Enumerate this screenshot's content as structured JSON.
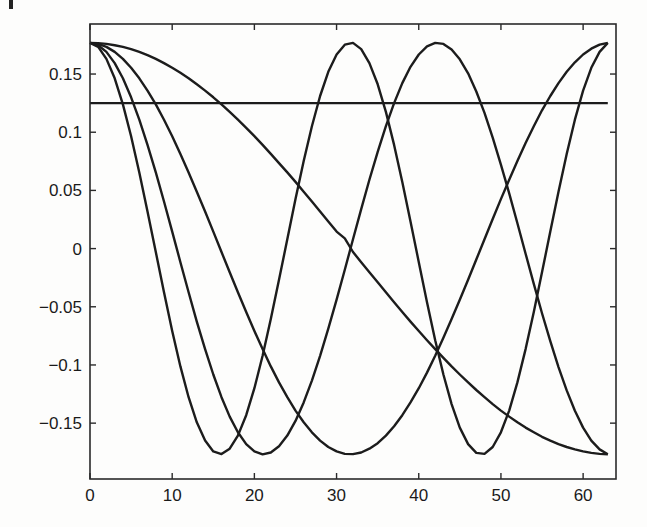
{
  "chart_data": {
    "type": "line",
    "title": "",
    "xlabel": "",
    "ylabel": "",
    "xlim": [
      0,
      64
    ],
    "ylim": [
      -0.198,
      0.193
    ],
    "grid": false,
    "legend": null,
    "x_ticks": [
      0,
      10,
      20,
      30,
      40,
      50,
      60
    ],
    "x_tick_labels": [
      "0",
      "10",
      "20",
      "30",
      "40",
      "50",
      "60"
    ],
    "y_ticks": [
      0.15,
      0.1,
      0.05,
      0,
      -0.05,
      -0.1,
      -0.15
    ],
    "y_tick_labels": [
      "0.15",
      "0.1",
      "0.05",
      "0",
      "−0.05",
      "−0.1",
      "−0.15"
    ],
    "x": [
      0,
      1,
      2,
      3,
      4,
      5,
      6,
      7,
      8,
      9,
      10,
      11,
      12,
      13,
      14,
      15,
      16,
      17,
      18,
      19,
      20,
      21,
      22,
      23,
      24,
      25,
      26,
      27,
      28,
      29,
      30,
      31,
      32,
      33,
      34,
      35,
      36,
      37,
      38,
      39,
      40,
      41,
      42,
      43,
      44,
      45,
      46,
      47,
      48,
      49,
      50,
      51,
      52,
      53,
      54,
      55,
      56,
      57,
      58,
      59,
      60,
      61,
      62,
      63
    ],
    "series": [
      {
        "name": "k=0",
        "values": [
          0.125,
          0.125,
          0.125,
          0.125,
          0.125,
          0.125,
          0.125,
          0.125,
          0.125,
          0.125,
          0.125,
          0.125,
          0.125,
          0.125,
          0.125,
          0.125,
          0.125,
          0.125,
          0.125,
          0.125,
          0.125,
          0.125,
          0.125,
          0.125,
          0.125,
          0.125,
          0.125,
          0.125,
          0.125,
          0.125,
          0.125,
          0.125,
          0.125,
          0.125,
          0.125,
          0.125,
          0.125,
          0.125,
          0.125,
          0.125,
          0.125,
          0.125,
          0.125,
          0.125,
          0.125,
          0.125,
          0.125,
          0.125,
          0.125,
          0.125,
          0.125,
          0.125,
          0.125,
          0.125,
          0.125,
          0.125,
          0.125,
          0.125,
          0.125,
          0.125,
          0.125,
          0.125,
          0.125,
          0.125
        ]
      },
      {
        "name": "k=1",
        "values": [
          0.1768,
          0.1766,
          0.1759,
          0.1748,
          0.1733,
          0.1714,
          0.169,
          0.1662,
          0.163,
          0.1594,
          0.1554,
          0.1511,
          0.1463,
          0.1412,
          0.1358,
          0.13,
          0.1239,
          0.1175,
          0.1108,
          0.1038,
          0.0966,
          0.0891,
          0.0814,
          0.0735,
          0.0655,
          0.0573,
          0.0489,
          0.0405,
          0.0319,
          0.0233,
          0.0146,
          0.0088,
          -0.0029,
          -0.0117,
          -0.0204,
          -0.029,
          -0.0376,
          -0.0461,
          -0.0545,
          -0.0627,
          -0.0708,
          -0.0787,
          -0.0864,
          -0.0939,
          -0.1012,
          -0.1082,
          -0.115,
          -0.1215,
          -0.1277,
          -0.1336,
          -0.1392,
          -0.1444,
          -0.1493,
          -0.1538,
          -0.1579,
          -0.1617,
          -0.165,
          -0.168,
          -0.1705,
          -0.1726,
          -0.1743,
          -0.1756,
          -0.1764,
          -0.1768
        ]
      },
      {
        "name": "k=2",
        "values": [
          0.1768,
          0.1759,
          0.1733,
          0.169,
          0.163,
          0.1554,
          0.1463,
          0.1358,
          0.1239,
          0.1108,
          0.0966,
          0.0814,
          0.0655,
          0.0489,
          0.0319,
          0.0146,
          -0.0029,
          -0.0204,
          -0.0376,
          -0.0545,
          -0.0708,
          -0.0864,
          -0.1012,
          -0.115,
          -0.1277,
          -0.1392,
          -0.1493,
          -0.1579,
          -0.165,
          -0.1705,
          -0.1743,
          -0.1764,
          -0.1766,
          -0.1752,
          -0.172,
          -0.1672,
          -0.1607,
          -0.1527,
          -0.1432,
          -0.1322,
          -0.12,
          -0.1066,
          -0.0921,
          -0.0767,
          -0.0606,
          -0.0439,
          -0.0268,
          -0.0094,
          0.008,
          0.0254,
          0.0425,
          0.0592,
          0.0753,
          0.0907,
          0.1052,
          0.1188,
          0.1311,
          0.1422,
          0.1519,
          0.1601,
          0.1668,
          0.1718,
          0.1752,
          0.1768
        ]
      },
      {
        "name": "k=3",
        "values": [
          0.1768,
          0.1748,
          0.169,
          0.1594,
          0.1463,
          0.13,
          0.1108,
          0.0891,
          0.0655,
          0.0405,
          0.0146,
          -0.0117,
          -0.0376,
          -0.0627,
          -0.0864,
          -0.1082,
          -0.1277,
          -0.1444,
          -0.1579,
          -0.168,
          -0.1743,
          -0.1768,
          -0.1752,
          -0.1698,
          -0.1607,
          -0.1481,
          -0.1322,
          -0.1134,
          -0.0921,
          -0.0688,
          -0.0439,
          -0.0181,
          0.008,
          0.0339,
          0.0592,
          0.0832,
          0.1052,
          0.125,
          0.1422,
          0.1562,
          0.1668,
          0.1738,
          0.1768,
          0.1759,
          0.1711,
          0.1627,
          0.1506,
          0.135,
          0.1166,
          0.0954,
          0.0721,
          0.0474,
          0.0217,
          -0.0044,
          -0.0303,
          -0.0556,
          -0.0795,
          -0.1018,
          -0.1219,
          -0.1394,
          -0.1538,
          -0.165,
          -0.1726,
          -0.1768
        ]
      },
      {
        "name": "k=4",
        "values": [
          0.1768,
          0.1733,
          0.163,
          0.1463,
          0.1239,
          0.0966,
          0.0655,
          0.0319,
          -0.0029,
          -0.0376,
          -0.0708,
          -0.1012,
          -0.1277,
          -0.1493,
          -0.165,
          -0.1743,
          -0.1766,
          -0.172,
          -0.1607,
          -0.1432,
          -0.12,
          -0.0921,
          -0.0606,
          -0.0268,
          0.008,
          0.0425,
          0.0753,
          0.1052,
          0.1311,
          0.1519,
          0.1668,
          0.1752,
          0.1768,
          0.1714,
          0.1594,
          0.1412,
          0.1175,
          0.0891,
          0.0573,
          0.0233,
          -0.0117,
          -0.0461,
          -0.0787,
          -0.1082,
          -0.1336,
          -0.1538,
          -0.168,
          -0.1756,
          -0.1764,
          -0.1705,
          -0.1579,
          -0.1392,
          -0.115,
          -0.0864,
          -0.0545,
          -0.0204,
          0.0146,
          0.0489,
          0.0814,
          0.1108,
          0.1358,
          0.1554,
          0.169,
          0.1768
        ]
      }
    ]
  },
  "style": {
    "line_color": "#1c1c1c",
    "axis_color": "#2a2a2a",
    "background": "#fdfdfc"
  }
}
